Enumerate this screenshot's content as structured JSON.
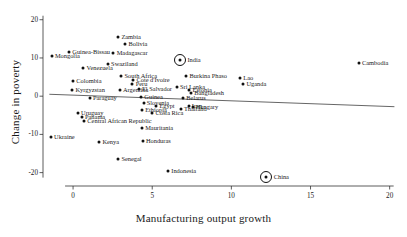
{
  "chart_data": {
    "type": "scatter",
    "title": "",
    "xlabel": "Manufacturing output growth",
    "ylabel": "Change in poverty",
    "xlim": [
      -1.9,
      20.4
    ],
    "ylim": [
      -23.5,
      21.5
    ],
    "xticks": [
      0,
      5,
      10,
      15,
      20
    ],
    "yticks": [
      20,
      10,
      0,
      -10,
      -20
    ],
    "xtick_labels": [
      "0",
      "5",
      "10",
      "15",
      "20"
    ],
    "ytick_labels": [
      "20",
      "10",
      "0",
      "-10",
      "-20"
    ],
    "grid": false,
    "legend": "none",
    "trendline": {
      "type": "linear-fit",
      "x_start": -1.5,
      "y_start": 0.5,
      "x_end": 20.3,
      "y_end": -2.75,
      "color": "#555555"
    },
    "highlight_markers": [
      "India",
      "China"
    ],
    "points": [
      {
        "name": "Mongolia",
        "x": -1.35,
        "y": 10.4,
        "side": "right"
      },
      {
        "name": "Guinea-Bissau",
        "x": -0.25,
        "y": 11.5,
        "side": "right"
      },
      {
        "name": "Zambia",
        "x": 2.85,
        "y": 15.4,
        "side": "right"
      },
      {
        "name": "Bolivia",
        "x": 3.3,
        "y": 13.6,
        "side": "right"
      },
      {
        "name": "Madagascar",
        "x": 2.55,
        "y": 11.2,
        "side": "right"
      },
      {
        "name": "India",
        "x": 6.75,
        "y": 9.5,
        "side": "right",
        "highlight": true
      },
      {
        "name": "Cambodia",
        "x": 18.05,
        "y": 8.7,
        "side": "right"
      },
      {
        "name": "Swaziland",
        "x": 2.2,
        "y": 8.3,
        "side": "right"
      },
      {
        "name": "Venezuela",
        "x": 0.65,
        "y": 7.3,
        "side": "right"
      },
      {
        "name": "South Africa",
        "x": 3.05,
        "y": 5.4,
        "side": "right"
      },
      {
        "name": "Burkina Phaso",
        "x": 7.15,
        "y": 5.2,
        "side": "right"
      },
      {
        "name": "Cote d'Ivoire",
        "x": 3.8,
        "y": 4.2,
        "side": "right"
      },
      {
        "name": "Colombia",
        "x": 0.0,
        "y": 4.0,
        "side": "right"
      },
      {
        "name": "Lao",
        "x": 10.55,
        "y": 4.7,
        "side": "right"
      },
      {
        "name": "Uganda",
        "x": 10.75,
        "y": 3.3,
        "side": "right"
      },
      {
        "name": "Peru",
        "x": 3.75,
        "y": 3.1,
        "side": "right"
      },
      {
        "name": "Sri Lanka",
        "x": 6.55,
        "y": 2.4,
        "side": "right"
      },
      {
        "name": "Kyrgyzstan",
        "x": -0.05,
        "y": 1.7,
        "side": "right"
      },
      {
        "name": "El Salvador",
        "x": 4.15,
        "y": 1.9,
        "side": "right"
      },
      {
        "name": "Estonia",
        "x": 7.35,
        "y": 1.5,
        "side": "right"
      },
      {
        "name": "Bangladesh",
        "x": 7.45,
        "y": 0.9,
        "side": "right"
      },
      {
        "name": "Paraguay",
        "x": 1.05,
        "y": -0.5,
        "side": "right"
      },
      {
        "name": "Guinea",
        "x": 4.3,
        "y": -0.25,
        "side": "right"
      },
      {
        "name": "Belarus",
        "x": 6.95,
        "y": -0.45,
        "side": "right"
      },
      {
        "name": "Argentina",
        "x": 2.95,
        "y": 1.6,
        "side": "right"
      },
      {
        "name": "Slovenia",
        "x": 4.45,
        "y": -1.9,
        "side": "right"
      },
      {
        "name": "Iran",
        "x": 7.3,
        "y": -2.5,
        "side": "right"
      },
      {
        "name": "Hungary",
        "x": 7.55,
        "y": -2.9,
        "side": "right"
      },
      {
        "name": "Egypt",
        "x": 5.25,
        "y": -2.6,
        "side": "right"
      },
      {
        "name": "Thailand",
        "x": 6.8,
        "y": -3.4,
        "side": "right"
      },
      {
        "name": "Ethiopia",
        "x": 4.35,
        "y": -3.7,
        "side": "right"
      },
      {
        "name": "Costa Rica",
        "x": 5.0,
        "y": -4.3,
        "side": "right"
      },
      {
        "name": "Uruguay",
        "x": 0.3,
        "y": -4.5,
        "side": "right"
      },
      {
        "name": "Panama",
        "x": 0.55,
        "y": -5.4,
        "side": "right"
      },
      {
        "name": "Central African Republic",
        "x": 0.7,
        "y": -6.6,
        "side": "right"
      },
      {
        "name": "Mauritania",
        "x": 4.35,
        "y": -8.2,
        "side": "right"
      },
      {
        "name": "Ukraine",
        "x": -1.4,
        "y": -10.7,
        "side": "right"
      },
      {
        "name": "Honduras",
        "x": 4.4,
        "y": -11.6,
        "side": "right"
      },
      {
        "name": "Kenya",
        "x": 1.65,
        "y": -12.0,
        "side": "right"
      },
      {
        "name": "Senegal",
        "x": 2.85,
        "y": -16.5,
        "side": "right"
      },
      {
        "name": "Indonesia",
        "x": 6.0,
        "y": -19.5,
        "side": "right"
      },
      {
        "name": "China",
        "x": 12.2,
        "y": -21.1,
        "side": "right",
        "highlight": true
      }
    ]
  }
}
